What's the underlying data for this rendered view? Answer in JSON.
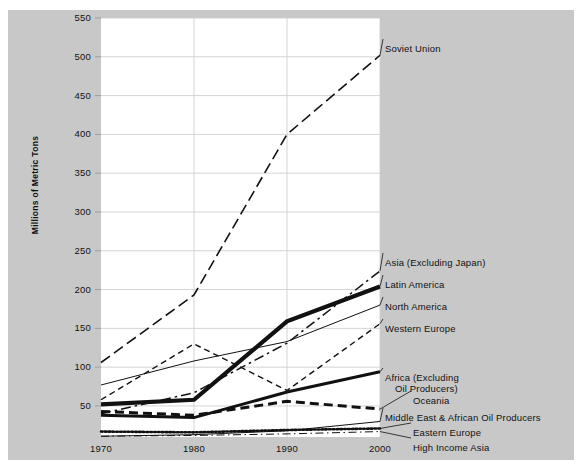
{
  "chart_data": {
    "type": "line",
    "title": "",
    "xlabel": "",
    "ylabel": "Millions of Metric Tons",
    "x": [
      1970,
      1980,
      1990,
      2000
    ],
    "xticklabels": [
      "1970",
      "1980",
      "1990",
      "2000"
    ],
    "xlim": [
      1970,
      2000
    ],
    "ylim": [
      10,
      550
    ],
    "yticks": [
      50,
      100,
      150,
      200,
      250,
      300,
      350,
      400,
      450,
      500,
      550
    ],
    "yticklabels": [
      "50",
      "100",
      "150",
      "200",
      "250",
      "300",
      "350",
      "400",
      "450",
      "500",
      "550"
    ],
    "grid": true,
    "legend_position": "right-inline-labels",
    "series": [
      {
        "name": "Soviet Union",
        "style": "long-dash",
        "width": 1.6,
        "color": "#111111",
        "values": [
          106,
          193,
          400,
          502
        ]
      },
      {
        "name": "Asia (Excluding Japan)",
        "style": "dash-dot",
        "width": 1.5,
        "color": "#111111",
        "values": [
          40,
          67,
          131,
          224
        ]
      },
      {
        "name": "Latin America",
        "style": "solid",
        "width": 4.2,
        "color": "#111111",
        "values": [
          52,
          58,
          159,
          204
        ]
      },
      {
        "name": "North America",
        "style": "solid",
        "width": 1.0,
        "color": "#111111",
        "values": [
          77,
          108,
          133,
          180
        ]
      },
      {
        "name": "Western Europe",
        "style": "short-dash",
        "width": 1.4,
        "color": "#111111",
        "values": [
          58,
          130,
          70,
          156
        ]
      },
      {
        "name": "Africa (Excluding Oil Producers)",
        "style": "solid",
        "width": 3.0,
        "color": "#111111",
        "values": [
          38,
          35,
          68,
          94
        ]
      },
      {
        "name": "Oceania",
        "style": "medium-dash",
        "width": 3.0,
        "color": "#111111",
        "values": [
          43,
          38,
          56,
          46
        ]
      },
      {
        "name": "Middle East & African Oil Producers",
        "style": "solid",
        "width": 1.0,
        "color": "#111111",
        "values": [
          11,
          13,
          18,
          30
        ]
      },
      {
        "name": "Eastern Europe",
        "style": "dotted",
        "width": 2.6,
        "color": "#111111",
        "values": [
          17,
          16,
          19,
          21
        ]
      },
      {
        "name": "High Income Asia",
        "style": "dash-dot-thin",
        "width": 1.0,
        "color": "#111111",
        "values": [
          11,
          12,
          14,
          17
        ]
      }
    ],
    "annotations": [
      {
        "text": "Soviet Union",
        "lines": [
          "Soviet Union"
        ],
        "x": 385,
        "y": 53
      },
      {
        "text": "Asia (Excluding Japan)",
        "lines": [
          "Asia (Excluding Japan)"
        ],
        "x": 385,
        "y": 267
      },
      {
        "text": "Latin America",
        "lines": [
          "Latin America"
        ],
        "x": 385,
        "y": 289
      },
      {
        "text": "North America",
        "lines": [
          "North America"
        ],
        "x": 385,
        "y": 311
      },
      {
        "text": "Western Europe",
        "lines": [
          "Western Europe"
        ],
        "x": 385,
        "y": 333
      },
      {
        "text": "Africa (Excluding Oil Producers)",
        "lines": [
          "Africa (Excluding",
          "Oil Producers)"
        ],
        "x": 385,
        "y": 382
      },
      {
        "text": "Oceania",
        "lines": [
          "Oceania"
        ],
        "x": 413,
        "y": 405
      },
      {
        "text": "Middle East & African Oil Producers",
        "lines": [
          "Middle East & African Oil Producers"
        ],
        "x": 385,
        "y": 422
      },
      {
        "text": "Eastern Europe",
        "lines": [
          "Eastern Europe"
        ],
        "x": 413,
        "y": 437
      },
      {
        "text": "High Income Asia",
        "lines": [
          "High Income Asia"
        ],
        "x": 413,
        "y": 452
      }
    ]
  },
  "colors": {
    "background": "#c8c8c8",
    "plot_background": "#ffffff",
    "ink": "#111111",
    "grid": "#cfcfcf"
  }
}
